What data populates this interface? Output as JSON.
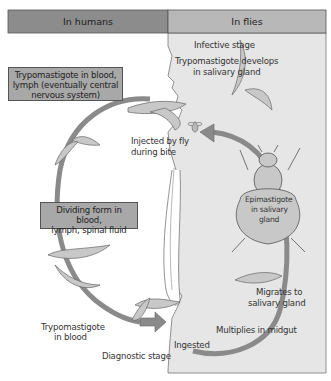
{
  "header": {
    "left_label": "In humans",
    "right_label": "In flies"
  },
  "colors": {
    "header_left": "#8c8c8c",
    "header_right": "#b8b8b8",
    "flies_panel": "#e6e6e6",
    "cycle_arrow": "#8a8a8a",
    "box_fill": "#a8a8a8",
    "parasite_fill": "#c8c8c8",
    "fly_fill": "#c8c8c8"
  },
  "labels": {
    "infective_stage": "Infective stage",
    "trypo_salivary_line1": "Trypomastigote develops",
    "trypo_salivary_line2": "in salivary gland",
    "injected_line1": "Injected by fly",
    "injected_line2": "during bite",
    "epimastigote_line1": "Epimastigote",
    "epimastigote_line2": "in salivary",
    "epimastigote_line3": "gland",
    "migrates_line1": "Migrates to",
    "migrates_line2": "salivary gland",
    "multiplies": "Multiplies in midgut",
    "ingested": "Ingested",
    "diagnostic": "Diagnostic stage",
    "trypo_blood_line1": "Trypomastigote",
    "trypo_blood_line2": "in blood"
  },
  "boxes": {
    "box1_line1": "Trypomastigote in blood,",
    "box1_line2": "lymph (eventually central",
    "box1_line3": "nervous system)",
    "box2_line1": "Dividing form in blood,",
    "box2_line2": "lymph, spinal fluid"
  }
}
